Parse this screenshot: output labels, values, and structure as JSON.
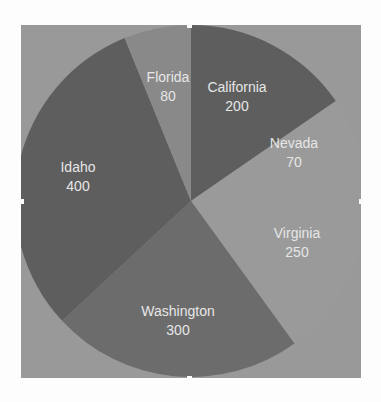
{
  "chart_data": {
    "type": "pie",
    "title": "",
    "start_angle_deg": 0,
    "direction": "clockwise",
    "categories": [
      "California",
      "Nevada",
      "Virginia",
      "Washington",
      "Idaho",
      "Florida"
    ],
    "values": [
      200,
      70,
      250,
      300,
      400,
      80
    ],
    "colors": [
      "#5e5e5e",
      "#9a9a9a",
      "#9a9a9a",
      "#6c6c6c",
      "#5e5e5e",
      "#898989"
    ],
    "legend": "none",
    "labels_show_value": true,
    "background": "#999999"
  },
  "labels": [
    {
      "name": "California",
      "value": "200"
    },
    {
      "name": "Nevada",
      "value": "70"
    },
    {
      "name": "Virginia",
      "value": "250"
    },
    {
      "name": "Washington",
      "value": "300"
    },
    {
      "name": "Idaho",
      "value": "400"
    },
    {
      "name": "Florida",
      "value": "80"
    }
  ]
}
